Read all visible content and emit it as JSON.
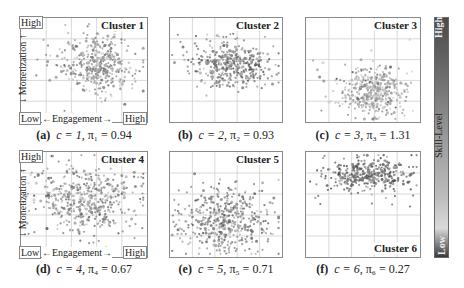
{
  "figure": {
    "x_axis": {
      "label": "Engagement",
      "low": "Low",
      "high": "High"
    },
    "y_axis": {
      "label": "Monetization",
      "low": "Low",
      "high": "High"
    },
    "colorbar": {
      "label": "Skill-Level",
      "low": "Low",
      "high": "High"
    }
  },
  "chart_data": [
    {
      "type": "scatter",
      "panel": "(a)",
      "title": "Cluster 1",
      "c": 1,
      "pi": "0.94",
      "caption_c": "c = 1,",
      "caption_pi": "π₁ = 0.94",
      "center": [
        0.62,
        0.55
      ],
      "spread": [
        0.14,
        0.14
      ],
      "n": 420,
      "tone": 0.6
    },
    {
      "type": "scatter",
      "panel": "(b)",
      "title": "Cluster 2",
      "c": 2,
      "pi": "0.93",
      "caption_c": "c = 2,",
      "caption_pi": "π₂ = 0.93",
      "center": [
        0.55,
        0.55
      ],
      "spread": [
        0.17,
        0.1
      ],
      "n": 420,
      "tone": 0.45
    },
    {
      "type": "scatter",
      "panel": "(c)",
      "title": "Cluster 3",
      "c": 3,
      "pi": "1.31",
      "caption_c": "c = 3,",
      "caption_pi": "π₃ = 1.31",
      "center": [
        0.58,
        0.3
      ],
      "spread": [
        0.14,
        0.12
      ],
      "n": 420,
      "tone": 0.7
    },
    {
      "type": "scatter",
      "panel": "(d)",
      "title": "Cluster 4",
      "c": 4,
      "pi": "0.67",
      "caption_c": "c = 4,",
      "caption_pi": "π₄ = 0.67",
      "center": [
        0.5,
        0.55
      ],
      "spread": [
        0.2,
        0.17
      ],
      "n": 480,
      "tone": 0.55
    },
    {
      "type": "scatter",
      "panel": "(e)",
      "title": "Cluster 5",
      "c": 5,
      "pi": "0.71",
      "caption_c": "c = 5,",
      "caption_pi": "π₅ = 0.71",
      "center": [
        0.48,
        0.35
      ],
      "spread": [
        0.2,
        0.16
      ],
      "n": 480,
      "tone": 0.5
    },
    {
      "type": "scatter",
      "panel": "(f)",
      "title": "Cluster 6",
      "c": 6,
      "pi": "0.27",
      "caption_c": "c = 6,",
      "caption_pi": "π₆ = 0.27",
      "center": [
        0.55,
        0.78
      ],
      "spread": [
        0.18,
        0.08
      ],
      "n": 380,
      "tone": 0.35
    }
  ]
}
